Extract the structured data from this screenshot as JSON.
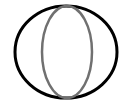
{
  "icon": {
    "name": "sphere-icon",
    "outer_ellipse": {
      "cx": 66,
      "cy": 52,
      "rx": 51,
      "ry": 46,
      "stroke": "#000000",
      "stroke_width": 3
    },
    "inner_ellipse": {
      "cx": 67,
      "cy": 52,
      "rx": 25,
      "ry": 46,
      "stroke": "#707070",
      "stroke_width": 2.5
    }
  }
}
